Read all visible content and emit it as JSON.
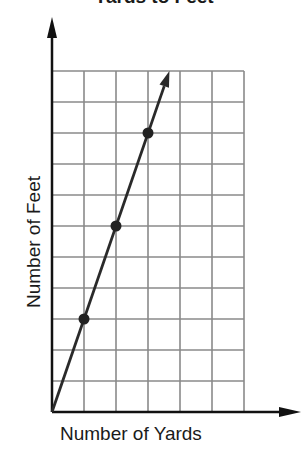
{
  "chart_data": {
    "type": "line",
    "title": "Yards to Feet",
    "xlabel": "Number of Yards",
    "ylabel": "Number of Feet",
    "xlim": [
      0,
      6
    ],
    "ylim": [
      0,
      11
    ],
    "grid": true,
    "grid_columns": 6,
    "grid_rows": 11,
    "tick_labels_shown": false,
    "series": [
      {
        "name": "Yards to Feet",
        "line_from": [
          0,
          0
        ],
        "line_to_arrow": [
          3.67,
          11
        ],
        "points": [
          {
            "x": 1,
            "y": 3
          },
          {
            "x": 2,
            "y": 6
          },
          {
            "x": 3,
            "y": 9
          }
        ]
      }
    ]
  },
  "colors": {
    "grid": "#8a8a8a",
    "axis": "#111111",
    "line": "#2a2a2a",
    "points": "#222222"
  }
}
